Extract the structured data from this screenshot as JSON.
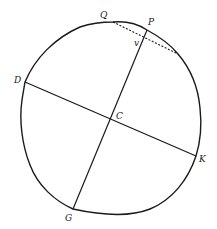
{
  "diagram": {
    "type": "circle-construction",
    "stroke_color": "#1a1a1a",
    "background": "#ffffff",
    "labels": {
      "Q": "Q",
      "P": "P",
      "v": "v",
      "D": "D",
      "C": "C",
      "K": "K",
      "G": "G"
    },
    "segments": [
      {
        "name": "diameter-PG",
        "from": "P",
        "to": "G",
        "style": "solid"
      },
      {
        "name": "diameter-DK",
        "from": "D",
        "to": "K",
        "style": "solid"
      },
      {
        "name": "chord-Q-through-v",
        "from": "Q",
        "to": "v",
        "style": "dashed"
      }
    ]
  }
}
